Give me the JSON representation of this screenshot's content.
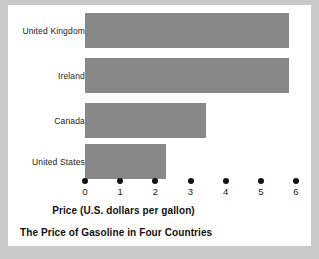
{
  "chart_data": {
    "type": "bar",
    "orientation": "horizontal",
    "title": "The Price of Gasoline in Four Countries",
    "xlabel": "Price (U.S. dollars per gallon)",
    "ylabel": "",
    "categories": [
      "United Kingdom",
      "Ireland",
      "Canada",
      "United States"
    ],
    "values": [
      5.8,
      5.8,
      3.45,
      2.3
    ],
    "xlim": [
      0,
      6
    ],
    "xticks": [
      0,
      1,
      2,
      3,
      4,
      5,
      6
    ],
    "xtick_labels": [
      "0",
      "1",
      "2",
      "3",
      "4",
      "5",
      "6"
    ],
    "grid": false,
    "legend": null,
    "bar_color": "#888888",
    "background_color": "#ffffff",
    "page_color": "#c9c9c9",
    "text_color": "#1a1a1a"
  }
}
